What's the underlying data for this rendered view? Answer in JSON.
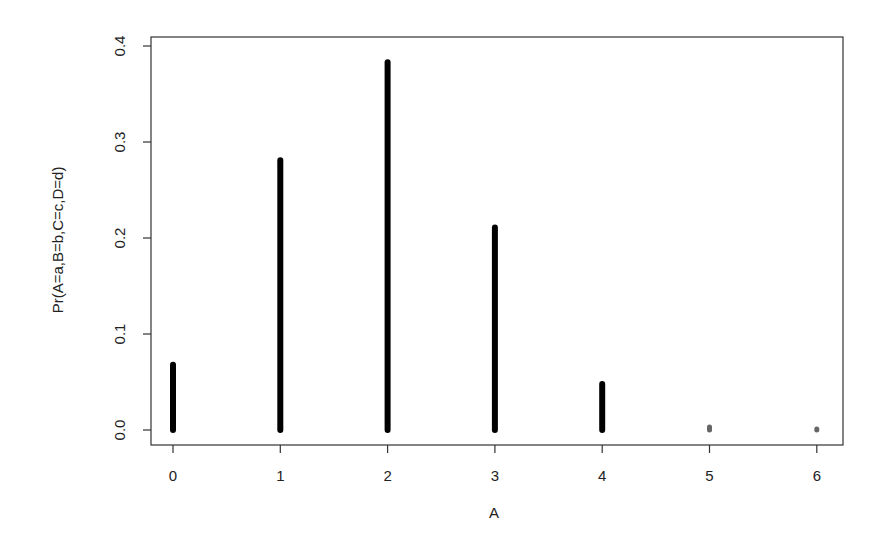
{
  "chart_data": {
    "type": "bar",
    "style": "stick (R type='h')",
    "title": "",
    "xlabel": "A",
    "ylabel": "Pr(A=a,B=b,C=c,D=d)",
    "categories": [
      "0",
      "1",
      "2",
      "3",
      "4",
      "5",
      "6"
    ],
    "x": [
      0,
      1,
      2,
      3,
      4,
      5,
      6
    ],
    "values": [
      0.068,
      0.281,
      0.383,
      0.211,
      0.048,
      0.003,
      0.0005
    ],
    "xlim": [
      -0.3,
      6.25
    ],
    "ylim": [
      0,
      0.41
    ],
    "x_ticks": [
      "0",
      "1",
      "2",
      "3",
      "4",
      "5",
      "6"
    ],
    "y_ticks": [
      "0.0",
      "0.1",
      "0.2",
      "0.3",
      "0.4"
    ],
    "grid": false,
    "legend": null,
    "bar_color": "#000000",
    "small_bar_color": "#666666"
  }
}
